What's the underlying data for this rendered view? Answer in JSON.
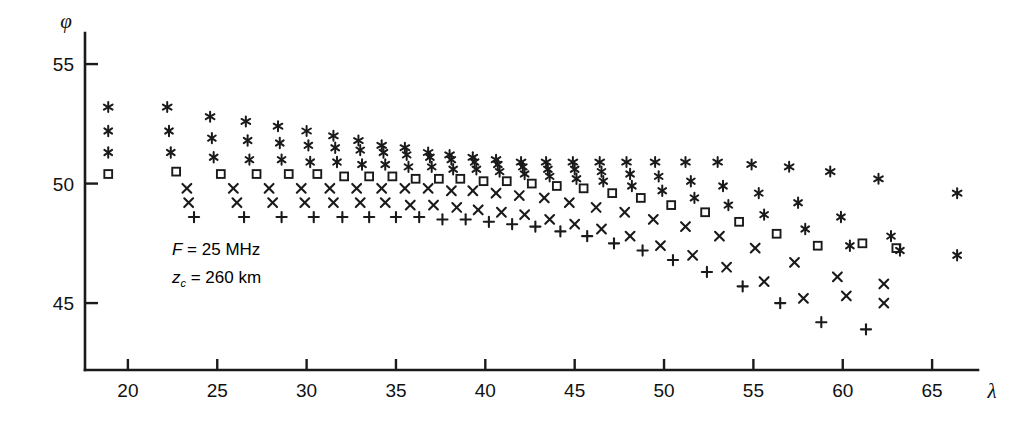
{
  "figure": {
    "type": "scatter-plot",
    "background": "#ffffff",
    "ink_color": "#1a1a1a"
  },
  "annotations": [
    {
      "name": "frequency",
      "symbol": "F",
      "equals": "= 25 MHz",
      "x": 172,
      "y": 240
    },
    {
      "name": "reflection-height",
      "symbol": "z",
      "sub": "c",
      "equals": "= 260 km",
      "x": 172,
      "y": 268
    }
  ],
  "axes": {
    "x": {
      "label": "λ",
      "label_x": 992,
      "label_y": 398,
      "ticks": [
        20,
        25,
        30,
        35,
        40,
        45,
        50,
        55,
        60,
        65
      ],
      "min": 17.6,
      "max": 67.4,
      "pixel_min": 85,
      "pixel_max": 975,
      "baseline_y": 370
    },
    "y": {
      "label": "φ",
      "label_x": 66,
      "label_y": 28,
      "ticks": [
        45,
        50,
        55
      ],
      "min": 42.2,
      "max": 56.3,
      "pixel_min": 370,
      "pixel_max": 33,
      "axis_x": 85
    }
  },
  "chart_data": {
    "type": "scatter",
    "title": "",
    "xlabel": "λ",
    "ylabel": "φ",
    "xlim": [
      17.6,
      67.4
    ],
    "ylim": [
      42.2,
      56.3
    ],
    "grid": false,
    "legend": "none",
    "xticks": [
      20,
      25,
      30,
      35,
      40,
      45,
      50,
      55,
      60,
      65
    ],
    "yticks": [
      45,
      50,
      55
    ],
    "marker_styles": {
      "asterisk": "six-pointed asterisk",
      "star-y": "star with vertical stroke (upper)",
      "star-i": "star with vertical stroke (lower)",
      "square": "open square",
      "cross-a": "diagonal cross (upper)",
      "cross-b": "diagonal cross (lower)",
      "plus": "upright plus"
    },
    "series": [
      {
        "name": "asterisk",
        "marker": "asterisk",
        "x": [
          18.9,
          22.2,
          24.6,
          26.6,
          28.4,
          30.0,
          31.5,
          32.9,
          34.2,
          35.5,
          36.8,
          38.0,
          39.3,
          40.6,
          42.0,
          43.4,
          44.9,
          46.4,
          47.9,
          49.5,
          51.2,
          53.0,
          54.9,
          57.0,
          59.3,
          62.0,
          66.4
        ],
        "y": [
          53.2,
          53.2,
          52.8,
          52.6,
          52.4,
          52.2,
          52.0,
          51.8,
          51.6,
          51.5,
          51.3,
          51.2,
          51.1,
          51.0,
          50.9,
          50.9,
          50.9,
          50.9,
          50.9,
          50.9,
          50.9,
          50.9,
          50.8,
          50.7,
          50.5,
          50.2,
          49.6
        ]
      },
      {
        "name": "star-y",
        "marker": "star-y",
        "x": [
          18.9,
          22.3,
          24.7,
          26.7,
          28.5,
          30.1,
          31.6,
          33.0,
          34.3,
          35.6,
          36.9,
          38.1,
          39.4,
          40.7,
          42.1,
          43.5,
          45.0,
          46.5,
          48.1,
          49.7,
          51.5,
          53.3,
          55.3,
          57.5,
          59.9,
          62.7,
          66.4
        ],
        "y": [
          52.2,
          52.2,
          51.9,
          51.8,
          51.7,
          51.6,
          51.5,
          51.4,
          51.3,
          51.2,
          51.1,
          51.0,
          50.9,
          50.8,
          50.7,
          50.6,
          50.6,
          50.5,
          50.4,
          50.3,
          50.1,
          49.9,
          49.6,
          49.2,
          48.6,
          47.8,
          47.0
        ]
      },
      {
        "name": "star-i",
        "marker": "star-i",
        "x": [
          18.9,
          22.4,
          24.8,
          26.8,
          28.6,
          30.2,
          31.7,
          33.1,
          34.4,
          35.7,
          37.0,
          38.2,
          39.5,
          40.8,
          42.2,
          43.6,
          45.1,
          46.6,
          48.2,
          49.9,
          51.7,
          53.6,
          55.6,
          57.9,
          60.4,
          63.2
        ],
        "y": [
          51.3,
          51.3,
          51.1,
          51.0,
          51.0,
          50.9,
          50.9,
          50.8,
          50.8,
          50.7,
          50.7,
          50.6,
          50.6,
          50.5,
          50.4,
          50.3,
          50.2,
          50.1,
          49.9,
          49.7,
          49.4,
          49.1,
          48.7,
          48.1,
          47.4,
          47.2
        ]
      },
      {
        "name": "square",
        "marker": "square",
        "x": [
          18.9,
          22.7,
          25.2,
          27.2,
          29.0,
          30.6,
          32.1,
          33.5,
          34.8,
          36.1,
          37.4,
          38.6,
          39.9,
          41.2,
          42.6,
          44.0,
          45.5,
          47.1,
          48.7,
          50.4,
          52.3,
          54.2,
          56.3,
          58.6,
          61.1,
          63.0
        ],
        "y": [
          50.4,
          50.5,
          50.4,
          50.4,
          50.4,
          50.4,
          50.3,
          50.3,
          50.3,
          50.2,
          50.2,
          50.2,
          50.1,
          50.1,
          50.0,
          49.9,
          49.8,
          49.6,
          49.4,
          49.1,
          48.8,
          48.4,
          47.9,
          47.4,
          47.5,
          47.3
        ]
      },
      {
        "name": "cross-a",
        "marker": "cross-a",
        "x": [
          23.3,
          25.9,
          27.9,
          29.7,
          31.3,
          32.8,
          34.2,
          35.5,
          36.8,
          38.1,
          39.3,
          40.6,
          41.9,
          43.3,
          44.7,
          46.2,
          47.8,
          49.4,
          51.2,
          53.1,
          55.1,
          57.3,
          59.7,
          62.3
        ],
        "y": [
          49.8,
          49.8,
          49.8,
          49.8,
          49.8,
          49.8,
          49.8,
          49.8,
          49.8,
          49.7,
          49.7,
          49.6,
          49.5,
          49.4,
          49.2,
          49.0,
          48.8,
          48.5,
          48.2,
          47.8,
          47.3,
          46.7,
          46.1,
          45.8
        ]
      },
      {
        "name": "cross-b",
        "marker": "cross-b",
        "x": [
          23.4,
          26.1,
          28.1,
          29.9,
          31.5,
          33.0,
          34.4,
          35.8,
          37.1,
          38.4,
          39.6,
          40.9,
          42.2,
          43.6,
          45.0,
          46.5,
          48.1,
          49.8,
          51.6,
          53.5,
          55.6,
          57.8,
          60.2,
          62.3
        ],
        "y": [
          49.2,
          49.2,
          49.2,
          49.2,
          49.2,
          49.2,
          49.2,
          49.1,
          49.1,
          49.0,
          48.9,
          48.8,
          48.7,
          48.5,
          48.3,
          48.1,
          47.8,
          47.4,
          47.0,
          46.5,
          45.9,
          45.2,
          45.3,
          45.0
        ]
      },
      {
        "name": "plus",
        "marker": "plus",
        "x": [
          23.7,
          26.5,
          28.6,
          30.4,
          32.0,
          33.5,
          35.0,
          36.3,
          37.6,
          38.9,
          40.2,
          41.5,
          42.8,
          44.2,
          45.7,
          47.2,
          48.8,
          50.5,
          52.4,
          54.4,
          56.5,
          58.8,
          61.3
        ],
        "y": [
          48.6,
          48.6,
          48.6,
          48.6,
          48.6,
          48.6,
          48.6,
          48.6,
          48.5,
          48.5,
          48.4,
          48.3,
          48.2,
          48.0,
          47.8,
          47.5,
          47.2,
          46.8,
          46.3,
          45.7,
          45.0,
          44.2,
          43.9
        ]
      }
    ]
  }
}
